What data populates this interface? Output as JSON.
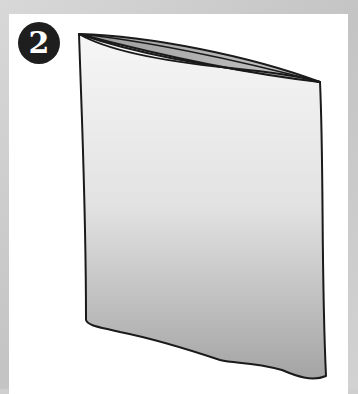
{
  "step": {
    "number": "2"
  },
  "illustration": {
    "subject": "open-bag",
    "colors": {
      "background": "#cfcfcf",
      "panel": "#ffffff",
      "badge": "#1e1e1e",
      "badge_text": "#ffffff",
      "bag_top": "#f4f4f4",
      "bag_bottom": "#a9a9a9",
      "outline": "#1a1a1a"
    }
  }
}
